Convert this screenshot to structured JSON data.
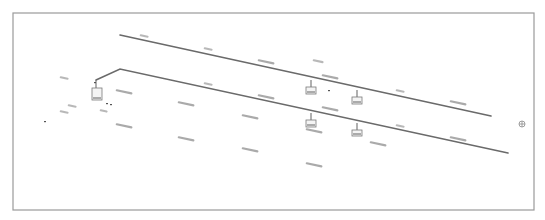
{
  "diagram": {
    "type": "isometric-line-diagram",
    "frame": {
      "x": 13,
      "y": 13,
      "width": 521,
      "height": 197,
      "stroke": "#9a9a9a"
    },
    "colors": {
      "line": "#6a6a6a",
      "label": "#8d8d8d",
      "background": "#ffffff"
    },
    "pipes": [
      {
        "name": "upper-run",
        "points": [
          [
            120,
            35
          ],
          [
            491,
            116
          ]
        ]
      },
      {
        "name": "lower-run",
        "points": [
          [
            96,
            80
          ],
          [
            120,
            69
          ],
          [
            508,
            153
          ]
        ]
      }
    ],
    "drops": [
      {
        "name": "drop-left-end",
        "x": 96,
        "y1": 80,
        "y2": 88,
        "box": [
          92,
          88,
          10,
          12
        ]
      },
      {
        "name": "drop-upper-1",
        "x": 311,
        "y1": 80,
        "y2": 87,
        "box": [
          306,
          87,
          10,
          7
        ]
      },
      {
        "name": "drop-upper-2",
        "x": 357,
        "y1": 90,
        "y2": 97,
        "box": [
          352,
          97,
          10,
          7
        ]
      },
      {
        "name": "drop-lower-1",
        "x": 311,
        "y1": 113,
        "y2": 120,
        "box": [
          306,
          120,
          10,
          7
        ]
      },
      {
        "name": "drop-lower-2",
        "x": 357,
        "y1": 123,
        "y2": 130,
        "box": [
          352,
          130,
          10,
          6
        ]
      }
    ],
    "labels_note": "Tag labels are illegible at this resolution; rendered as placeholder marks only.",
    "tags": [
      {
        "x": 140,
        "y": 34,
        "w": 9,
        "kind": "short"
      },
      {
        "x": 204,
        "y": 47,
        "w": 9,
        "kind": "short"
      },
      {
        "x": 258,
        "y": 59,
        "w": 17,
        "kind": "long"
      },
      {
        "x": 313,
        "y": 59,
        "w": 11,
        "kind": "short"
      },
      {
        "x": 322,
        "y": 74,
        "w": 17,
        "kind": "long"
      },
      {
        "x": 396,
        "y": 89,
        "w": 9,
        "kind": "short"
      },
      {
        "x": 450,
        "y": 100,
        "w": 17,
        "kind": "long"
      },
      {
        "x": 60,
        "y": 76,
        "w": 9,
        "kind": "short"
      },
      {
        "x": 116,
        "y": 89,
        "w": 17,
        "kind": "long"
      },
      {
        "x": 204,
        "y": 82,
        "w": 9,
        "kind": "short"
      },
      {
        "x": 258,
        "y": 94,
        "w": 17,
        "kind": "long"
      },
      {
        "x": 322,
        "y": 106,
        "w": 17,
        "kind": "long"
      },
      {
        "x": 396,
        "y": 124,
        "w": 9,
        "kind": "short"
      },
      {
        "x": 450,
        "y": 136,
        "w": 17,
        "kind": "long"
      },
      {
        "x": 178,
        "y": 101,
        "w": 17,
        "kind": "long"
      },
      {
        "x": 68,
        "y": 104,
        "w": 9,
        "kind": "short"
      },
      {
        "x": 60,
        "y": 110,
        "w": 9,
        "kind": "short"
      },
      {
        "x": 100,
        "y": 109,
        "w": 8,
        "kind": "short"
      },
      {
        "x": 116,
        "y": 123,
        "w": 17,
        "kind": "long"
      },
      {
        "x": 178,
        "y": 136,
        "w": 17,
        "kind": "long"
      },
      {
        "x": 242,
        "y": 114,
        "w": 17,
        "kind": "long"
      },
      {
        "x": 306,
        "y": 128,
        "w": 17,
        "kind": "long"
      },
      {
        "x": 370,
        "y": 141,
        "w": 17,
        "kind": "long"
      },
      {
        "x": 242,
        "y": 147,
        "w": 17,
        "kind": "long"
      },
      {
        "x": 306,
        "y": 162,
        "w": 17,
        "kind": "long"
      }
    ],
    "dots": [
      [
        44,
        121
      ],
      [
        110,
        104
      ],
      [
        94,
        82
      ],
      [
        328,
        90
      ],
      [
        106,
        103
      ]
    ],
    "symbol": {
      "name": "valve-symbol",
      "x": 522,
      "y": 124
    }
  }
}
